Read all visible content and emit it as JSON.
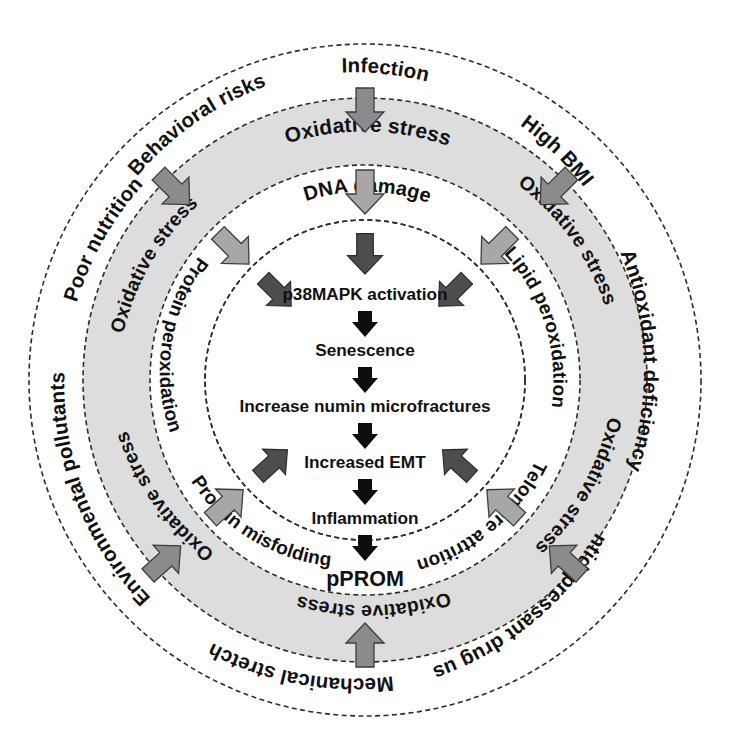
{
  "figure": {
    "center": {
      "cx": 365,
      "cy": 380
    },
    "colors": {
      "band_fill": "#dddddd",
      "ring_stroke": "#2b2b2b",
      "arrow_mid_gray": "#8b8b8b",
      "arrow_light_gray": "#a7a7a7",
      "arrow_dark_gray": "#4d4d4d",
      "arrow_black": "#0d0d0d",
      "background": "#ffffff",
      "text": "#111111"
    },
    "radii": {
      "outer": 336,
      "band_outer": 282,
      "band_inner": 215,
      "inner_ring": 160,
      "core": 115
    }
  },
  "outer_ring": {
    "name": "risk-factors-ring",
    "items": [
      {
        "label": "Behavioral risks",
        "angle": -58
      },
      {
        "label": "Infection",
        "angle": -18
      },
      {
        "label": "High BMI",
        "angle": 22
      },
      {
        "label": "Antioxidant deficiency",
        "angle": 62
      },
      {
        "label": "Antidepressant drug use",
        "angle": 118
      },
      {
        "label": "Mechanical stretch",
        "angle": 163
      },
      {
        "label": "Environmental pollutants",
        "angle": 212
      },
      {
        "label": "Poor nutrition",
        "angle": 258
      }
    ]
  },
  "band_ring": {
    "name": "oxidative-stress-ring",
    "label": "Oxidative stress",
    "top_label": "Oxidative  stress",
    "items": [
      {
        "label": "Oxidative  stress",
        "angle": -90
      },
      {
        "label": "Oxidative stress",
        "angle": -32
      },
      {
        "label": "Oxidative stress",
        "angle": 40
      },
      {
        "label": "Oxidative stress",
        "angle": 90
      },
      {
        "label": "Oxidative stress",
        "angle": 140
      },
      {
        "label": "Oxidative stress",
        "angle": 218
      }
    ]
  },
  "inner_ring": {
    "name": "damage-mechanisms-ring",
    "items": [
      {
        "label": "DNA damage",
        "angle": -90
      },
      {
        "label": "Lipid peroxidation",
        "angle": -20
      },
      {
        "label": "Telomere attrition",
        "angle": 52
      },
      {
        "label": "Protein misfolding",
        "angle": 128
      },
      {
        "label": "Protein peroxidation",
        "angle": 206
      }
    ]
  },
  "core_chain": {
    "name": "core-pathway",
    "steps": [
      "p38MAPK activation",
      "Senescence",
      "Increase numin microfractures",
      "Increased EMT",
      "Inflammation",
      "pPROM"
    ],
    "terminal": "pPROM",
    "arrow_count": 5
  },
  "arrows": {
    "vertical_top": [
      {
        "name": "arrow-outer-to-band",
        "shade": "mid"
      },
      {
        "name": "arrow-band-to-inner",
        "shade": "light"
      },
      {
        "name": "arrow-inner-to-core",
        "shade": "dark"
      }
    ],
    "radial": [
      {
        "name": "arrow-left-upper-outer-to-band",
        "shade": "mid"
      },
      {
        "name": "arrow-left-upper-band-to-inner",
        "shade": "light"
      },
      {
        "name": "arrow-left-upper-inner-to-core",
        "shade": "dark"
      },
      {
        "name": "arrow-right-upper-outer-to-band",
        "shade": "mid"
      },
      {
        "name": "arrow-right-upper-band-to-inner",
        "shade": "light"
      },
      {
        "name": "arrow-right-upper-inner-to-core",
        "shade": "dark"
      },
      {
        "name": "arrow-left-lower-outer-to-band",
        "shade": "mid"
      },
      {
        "name": "arrow-left-lower-band-to-inner",
        "shade": "light"
      },
      {
        "name": "arrow-left-lower-inner-to-core",
        "shade": "dark"
      },
      {
        "name": "arrow-right-lower-outer-to-band",
        "shade": "mid"
      },
      {
        "name": "arrow-right-lower-band-to-inner",
        "shade": "light"
      },
      {
        "name": "arrow-right-lower-inner-to-core",
        "shade": "dark"
      },
      {
        "name": "arrow-bottom-outer-to-band",
        "shade": "mid"
      }
    ]
  }
}
